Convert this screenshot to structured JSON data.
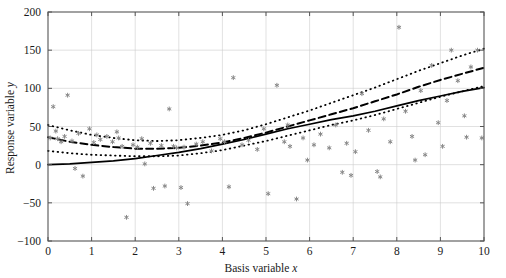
{
  "chart_data": {
    "type": "scatter",
    "title": "",
    "xlabel": "Basis variable x",
    "ylabel": "Response variable y",
    "xlim": [
      0,
      10
    ],
    "ylim": [
      -100,
      200
    ],
    "xticks": [
      0,
      1,
      2,
      3,
      4,
      5,
      6,
      7,
      8,
      9,
      10
    ],
    "yticks": [
      -100,
      -50,
      0,
      50,
      100,
      150,
      200
    ],
    "xtick_labels": [
      "0",
      "1",
      "2",
      "3",
      "4",
      "5",
      "6",
      "7",
      "8",
      "9",
      "10"
    ],
    "ytick_labels": [
      "-100",
      "-50",
      "0",
      "50",
      "100",
      "150",
      "200"
    ],
    "grid": true,
    "legend": "none",
    "marker": "asterisk",
    "marker_color": "#888888",
    "axis_color": "#555555",
    "grid_color": "#cccccc",
    "line_color": "#000000",
    "scatter": [
      [
        0.05,
        35
      ],
      [
        0.12,
        76
      ],
      [
        0.18,
        44
      ],
      [
        0.22,
        34
      ],
      [
        0.3,
        30
      ],
      [
        0.45,
        91
      ],
      [
        0.55,
        31
      ],
      [
        0.62,
        -5
      ],
      [
        0.7,
        41
      ],
      [
        0.8,
        -15
      ],
      [
        0.95,
        47
      ],
      [
        1.05,
        29
      ],
      [
        1.12,
        39
      ],
      [
        1.2,
        33
      ],
      [
        1.35,
        37
      ],
      [
        1.48,
        30
      ],
      [
        1.58,
        43
      ],
      [
        1.7,
        24
      ],
      [
        1.8,
        -69
      ],
      [
        1.95,
        26
      ],
      [
        2.05,
        23
      ],
      [
        2.15,
        34
      ],
      [
        2.22,
        1
      ],
      [
        2.35,
        28
      ],
      [
        2.42,
        -31
      ],
      [
        2.6,
        25
      ],
      [
        2.68,
        -28
      ],
      [
        2.78,
        73
      ],
      [
        2.95,
        22
      ],
      [
        3.05,
        -30
      ],
      [
        3.2,
        -51
      ],
      [
        3.4,
        27
      ],
      [
        3.55,
        30
      ],
      [
        3.75,
        18
      ],
      [
        3.95,
        34
      ],
      [
        4.15,
        -29
      ],
      [
        4.25,
        114
      ],
      [
        4.45,
        26
      ],
      [
        4.6,
        32
      ],
      [
        4.8,
        20
      ],
      [
        4.95,
        47
      ],
      [
        5.05,
        -38
      ],
      [
        5.25,
        104
      ],
      [
        5.42,
        30
      ],
      [
        5.55,
        24
      ],
      [
        5.7,
        -45
      ],
      [
        5.85,
        35
      ],
      [
        5.95,
        6
      ],
      [
        6.1,
        26
      ],
      [
        6.25,
        40
      ],
      [
        6.45,
        22
      ],
      [
        6.6,
        52
      ],
      [
        6.75,
        -10
      ],
      [
        6.85,
        28
      ],
      [
        7.05,
        17
      ],
      [
        7.2,
        93
      ],
      [
        7.35,
        45
      ],
      [
        7.55,
        -9
      ],
      [
        7.7,
        60
      ],
      [
        7.85,
        30
      ],
      [
        8.05,
        180
      ],
      [
        8.2,
        70
      ],
      [
        8.35,
        37
      ],
      [
        8.55,
        97
      ],
      [
        8.65,
        13
      ],
      [
        8.8,
        130
      ],
      [
        8.95,
        55
      ],
      [
        9.05,
        24
      ],
      [
        9.15,
        84
      ],
      [
        9.25,
        150
      ],
      [
        9.4,
        110
      ],
      [
        9.55,
        64
      ],
      [
        9.7,
        128
      ],
      [
        9.85,
        150
      ],
      [
        9.95,
        35
      ],
      [
        1.62,
        35
      ],
      [
        3.12,
        23
      ],
      [
        7.62,
        -16
      ],
      [
        8.42,
        6
      ],
      [
        6.95,
        -14
      ],
      [
        2.88,
        24
      ],
      [
        4.05,
        30
      ],
      [
        5.5,
        52
      ],
      [
        0.38,
        37
      ],
      [
        9.6,
        36
      ]
    ],
    "curves": [
      {
        "name": "fitted-curve",
        "style": "solid",
        "points": [
          [
            0.0,
            0
          ],
          [
            0.5,
            1
          ],
          [
            1.0,
            3
          ],
          [
            1.5,
            5
          ],
          [
            2.0,
            8
          ],
          [
            2.5,
            12
          ],
          [
            3.0,
            16
          ],
          [
            3.5,
            21
          ],
          [
            4.0,
            27
          ],
          [
            4.5,
            33
          ],
          [
            5.0,
            40
          ],
          [
            5.5,
            47
          ],
          [
            6.0,
            53
          ],
          [
            6.5,
            59
          ],
          [
            7.0,
            64
          ],
          [
            7.5,
            70
          ],
          [
            8.0,
            77
          ],
          [
            8.5,
            84
          ],
          [
            9.0,
            90
          ],
          [
            9.5,
            96
          ],
          [
            10.0,
            101
          ]
        ]
      },
      {
        "name": "estimated-mean-curve",
        "style": "dashed",
        "points": [
          [
            0.0,
            36
          ],
          [
            0.5,
            30
          ],
          [
            1.0,
            26
          ],
          [
            1.5,
            23
          ],
          [
            2.0,
            21
          ],
          [
            2.5,
            21
          ],
          [
            3.0,
            22
          ],
          [
            3.5,
            25
          ],
          [
            4.0,
            29
          ],
          [
            4.5,
            35
          ],
          [
            5.0,
            42
          ],
          [
            5.5,
            50
          ],
          [
            6.0,
            58
          ],
          [
            6.5,
            66
          ],
          [
            7.0,
            74
          ],
          [
            7.5,
            83
          ],
          [
            8.0,
            92
          ],
          [
            8.5,
            102
          ],
          [
            9.0,
            111
          ],
          [
            9.5,
            119
          ],
          [
            10.0,
            127
          ]
        ]
      },
      {
        "name": "upper-confidence-band",
        "style": "dotted",
        "points": [
          [
            0.0,
            52
          ],
          [
            0.5,
            45
          ],
          [
            1.0,
            39
          ],
          [
            1.5,
            35
          ],
          [
            2.0,
            32
          ],
          [
            2.5,
            31
          ],
          [
            3.0,
            32
          ],
          [
            3.5,
            35
          ],
          [
            4.0,
            39
          ],
          [
            4.5,
            45
          ],
          [
            5.0,
            53
          ],
          [
            5.5,
            62
          ],
          [
            6.0,
            71
          ],
          [
            6.5,
            81
          ],
          [
            7.0,
            91
          ],
          [
            7.5,
            101
          ],
          [
            8.0,
            112
          ],
          [
            8.5,
            123
          ],
          [
            9.0,
            133
          ],
          [
            9.5,
            143
          ],
          [
            10.0,
            152
          ]
        ]
      },
      {
        "name": "lower-confidence-band",
        "style": "dotted",
        "points": [
          [
            0.0,
            18
          ],
          [
            0.5,
            15
          ],
          [
            1.0,
            13
          ],
          [
            1.5,
            12
          ],
          [
            2.0,
            11
          ],
          [
            2.5,
            11
          ],
          [
            3.0,
            12
          ],
          [
            3.5,
            15
          ],
          [
            4.0,
            19
          ],
          [
            4.5,
            25
          ],
          [
            5.0,
            31
          ],
          [
            5.5,
            38
          ],
          [
            6.0,
            45
          ],
          [
            6.5,
            52
          ],
          [
            7.0,
            58
          ],
          [
            7.5,
            65
          ],
          [
            8.0,
            73
          ],
          [
            8.5,
            81
          ],
          [
            9.0,
            89
          ],
          [
            9.5,
            96
          ],
          [
            10.0,
            103
          ]
        ]
      }
    ]
  },
  "figure": {
    "xlabel_prefix": "Basis variable ",
    "xlabel_var": "x",
    "ylabel_prefix": "Response variable ",
    "ylabel_var": "y"
  }
}
